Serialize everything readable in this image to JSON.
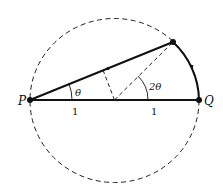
{
  "diagram": {
    "labels": {
      "point_p": "P",
      "point_q": "Q",
      "angle_theta": "θ",
      "angle_two_theta": "2θ",
      "segment_left": "1",
      "segment_right": "1"
    },
    "colors": {
      "stroke": "#111111",
      "background": "#ffffff"
    },
    "geometry": {
      "center": [
        114.5,
        100
      ],
      "radius": 84.5,
      "P": [
        30,
        100
      ],
      "Q": [
        199,
        100
      ],
      "A": [
        173,
        42
      ],
      "midpoint_PA": [
        108,
        70
      ]
    }
  }
}
